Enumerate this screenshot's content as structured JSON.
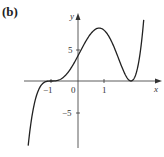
{
  "panel": {
    "label": "(b)"
  },
  "chart_data": {
    "type": "line",
    "title": "",
    "panel_label": "(b)",
    "xlabel": "x",
    "ylabel": "y",
    "function": "y = (x+1)^3 (x-2)^2",
    "x_ticks": [
      {
        "value": -1,
        "label": "−1"
      },
      {
        "value": 0,
        "label": "0"
      },
      {
        "value": 1,
        "label": "1"
      }
    ],
    "y_ticks": [
      {
        "value": 5,
        "label": "5"
      },
      {
        "value": -5,
        "label": "−5"
      }
    ],
    "xlim": [
      -2,
      2.5
    ],
    "ylim": [
      -10.5,
      10.5
    ],
    "grid": false,
    "legend": null,
    "series": [
      {
        "name": "f(x)",
        "x": [
          -1.85,
          -1.6,
          -1.4,
          -1.2,
          -1.0,
          -0.8,
          -0.6,
          -0.4,
          -0.2,
          0.0,
          0.2,
          0.4,
          0.6,
          0.8,
          1.0,
          1.2,
          1.4,
          1.6,
          1.8,
          2.0,
          2.2,
          2.4
        ],
        "y": [
          -10.5,
          -3.0,
          -0.74,
          -0.12,
          0.0,
          0.06,
          0.44,
          1.54,
          3.61,
          4.0,
          5.42,
          6.87,
          8.04,
          8.4,
          8.0,
          6.4,
          4.23,
          2.2,
          0.74,
          0.0,
          1.32,
          6.29
        ]
      }
    ],
    "annotations": [
      {
        "type": "triple_root_inflection",
        "x": -1,
        "y": 0
      },
      {
        "type": "local_max",
        "x": 0.8,
        "y": 8.4
      },
      {
        "type": "double_root_min",
        "x": 2,
        "y": 0
      },
      {
        "type": "y_intercept",
        "x": 0,
        "y": 4
      }
    ]
  },
  "labels": {
    "x_axis": "x",
    "y_axis": "y",
    "tick_neg1": "−1",
    "tick_0": "0",
    "tick_1": "1",
    "tick_5": "5",
    "tick_neg5": "−5"
  }
}
